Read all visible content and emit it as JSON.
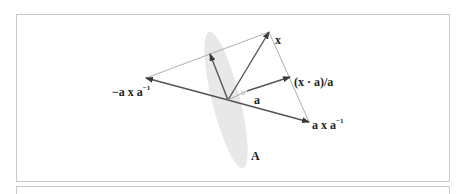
{
  "figure": {
    "labels": {
      "x": "x",
      "projection": "(x · a)/a",
      "a": "a",
      "a_x_a_inv_base": "a x a",
      "a_x_a_inv_sup": "−1",
      "neg_a_x_a_inv_base": "−a x a",
      "neg_a_x_a_inv_sup": "−1",
      "plane": "A"
    },
    "colors": {
      "vector": "#555555",
      "thin_line": "#9a9a9a",
      "plane_fill": "#e6e6e6",
      "a_head": "#cfcfcf",
      "frame": "#c8c8c8"
    },
    "icons": {
      "arrowhead": "arrowhead-icon"
    }
  }
}
